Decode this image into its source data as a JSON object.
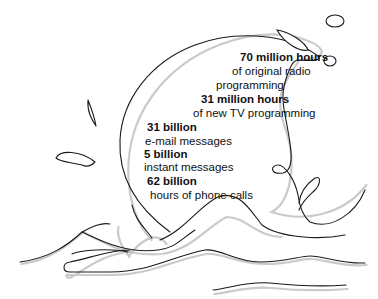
{
  "illustration": {
    "stats": [
      {
        "value": "70 million hours",
        "label_lines": [
          "of original radio",
          "programming"
        ]
      },
      {
        "value": "31 million hours",
        "label_lines": [
          "of new TV programming"
        ]
      },
      {
        "value": "31 billion",
        "label_lines": [
          "e-mail messages"
        ]
      },
      {
        "value": "5 billion",
        "label_lines": [
          "instant messages"
        ]
      },
      {
        "value": "62 billion",
        "label_lines": [
          "hours of phone calls"
        ]
      }
    ],
    "colors": {
      "line": "#1a1a1a",
      "shadow": "#bdbdbd",
      "background": "#ffffff"
    }
  }
}
